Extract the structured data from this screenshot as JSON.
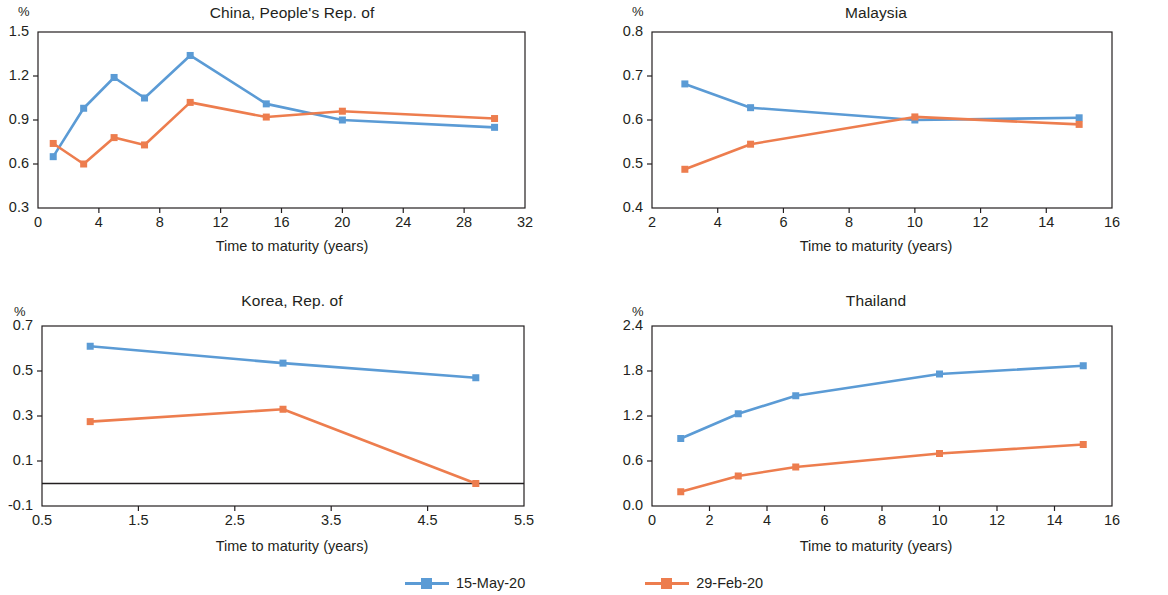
{
  "figure": {
    "unit_label": "%",
    "x_axis_title": "Time to maturity (years)"
  },
  "legend": {
    "position": "bottom-center",
    "entries": [
      {
        "label": "15-May-20",
        "color": "#5B9BD5",
        "marker": "square-marker"
      },
      {
        "label": "29-Feb-20",
        "color": "#ED7D4E",
        "marker": "square-marker"
      }
    ]
  },
  "colors": {
    "series_15_may_20": "#5B9BD5",
    "series_29_feb_20": "#ED7D4E",
    "axis": "#231f20",
    "background": "#FFFFFF"
  },
  "chart_data": [
    {
      "id": "china",
      "type": "line",
      "title": "China, People's Rep. of",
      "xlabel": "Time to maturity (years)",
      "ylabel": "%",
      "xlim": [
        0,
        32
      ],
      "ylim": [
        0.3,
        1.5
      ],
      "xticks": [
        0,
        4,
        8,
        12,
        16,
        20,
        24,
        28,
        32
      ],
      "xticklabels": [
        "0",
        "4",
        "8",
        "12",
        "16",
        "20",
        "24",
        "28",
        "32"
      ],
      "yticks": [
        0.3,
        0.6,
        0.9,
        1.2,
        1.5
      ],
      "yticklabels": [
        "0.3",
        "0.6",
        "0.9",
        "1.2",
        "1.5"
      ],
      "grid": false,
      "zero_line": false,
      "x": [
        1,
        3,
        5,
        7,
        10,
        15,
        20,
        30
      ],
      "series": [
        {
          "name": "15-May-20",
          "color": "#5B9BD5",
          "values": [
            0.65,
            0.98,
            1.19,
            1.05,
            1.34,
            1.01,
            0.9,
            0.85
          ]
        },
        {
          "name": "29-Feb-20",
          "color": "#ED7D4E",
          "values": [
            0.74,
            0.6,
            0.78,
            0.73,
            1.02,
            0.92,
            0.96,
            0.91
          ]
        }
      ]
    },
    {
      "id": "malaysia",
      "type": "line",
      "title": "Malaysia",
      "xlabel": "Time to maturity (years)",
      "ylabel": "%",
      "xlim": [
        2,
        16
      ],
      "ylim": [
        0.4,
        0.8
      ],
      "xticks": [
        2,
        4,
        6,
        8,
        10,
        12,
        14,
        16
      ],
      "xticklabels": [
        "2",
        "4",
        "6",
        "8",
        "10",
        "12",
        "14",
        "16"
      ],
      "yticks": [
        0.4,
        0.5,
        0.6,
        0.7,
        0.8
      ],
      "yticklabels": [
        "0.4",
        "0.5",
        "0.6",
        "0.7",
        "0.8"
      ],
      "grid": false,
      "zero_line": false,
      "x": [
        3,
        5,
        10,
        15
      ],
      "series": [
        {
          "name": "15-May-20",
          "color": "#5B9BD5",
          "values": [
            0.682,
            0.628,
            0.6,
            0.605
          ]
        },
        {
          "name": "29-Feb-20",
          "color": "#ED7D4E",
          "values": [
            0.488,
            0.545,
            0.607,
            0.59
          ]
        }
      ]
    },
    {
      "id": "korea",
      "type": "line",
      "title": "Korea, Rep. of",
      "xlabel": "Time to maturity (years)",
      "ylabel": "%",
      "xlim": [
        0.5,
        5.5
      ],
      "ylim": [
        -0.1,
        0.7
      ],
      "xticks": [
        0.5,
        1.5,
        2.5,
        3.5,
        4.5,
        5.5
      ],
      "xticklabels": [
        "0.5",
        "1.5",
        "2.5",
        "3.5",
        "4.5",
        "5.5"
      ],
      "yticks": [
        -0.1,
        0.1,
        0.3,
        0.5,
        0.7
      ],
      "yticklabels": [
        "-0.1",
        "0.1",
        "0.3",
        "0.5",
        "0.7"
      ],
      "grid": false,
      "zero_line": true,
      "x": [
        1,
        3,
        5
      ],
      "series": [
        {
          "name": "15-May-20",
          "color": "#5B9BD5",
          "values": [
            0.61,
            0.535,
            0.47
          ]
        },
        {
          "name": "29-Feb-20",
          "color": "#ED7D4E",
          "values": [
            0.275,
            0.33,
            0.0
          ]
        }
      ]
    },
    {
      "id": "thailand",
      "type": "line",
      "title": "Thailand",
      "xlabel": "Time to maturity (years)",
      "ylabel": "%",
      "xlim": [
        0,
        16
      ],
      "ylim": [
        0.0,
        2.4
      ],
      "xticks": [
        0,
        2,
        4,
        6,
        8,
        10,
        12,
        14,
        16
      ],
      "xticklabels": [
        "0",
        "2",
        "4",
        "6",
        "8",
        "10",
        "12",
        "14",
        "16"
      ],
      "yticks": [
        0.0,
        0.6,
        1.2,
        1.8,
        2.4
      ],
      "yticklabels": [
        "0.0",
        "0.6",
        "1.2",
        "1.8",
        "2.4"
      ],
      "grid": false,
      "zero_line": false,
      "x": [
        1,
        3,
        5,
        10,
        15
      ],
      "series": [
        {
          "name": "15-May-20",
          "color": "#5B9BD5",
          "values": [
            0.9,
            1.23,
            1.47,
            1.76,
            1.87
          ]
        },
        {
          "name": "29-Feb-20",
          "color": "#ED7D4E",
          "values": [
            0.19,
            0.4,
            0.52,
            0.7,
            0.82
          ]
        }
      ]
    }
  ]
}
